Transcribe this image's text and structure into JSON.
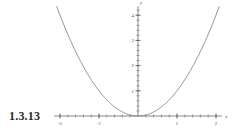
{
  "figure": {
    "exercise_label": "1.3.13",
    "background_color": "#ffffff",
    "curve_color": "#777777",
    "axis_color": "#555555"
  },
  "chart_data": {
    "type": "line",
    "title": "",
    "xlabel": "x",
    "ylabel": "y",
    "function": "y = x^2",
    "xlim": [
      -2.15,
      2.15
    ],
    "ylim": [
      0,
      4.35
    ],
    "grid": false,
    "legend": null,
    "x_ticklabels": [
      "-2",
      "-1",
      "1",
      "2"
    ],
    "x_tickvalues": [
      -2,
      -1,
      1,
      2
    ],
    "y_ticklabels": [
      "1",
      "2",
      "3",
      "4"
    ],
    "y_tickvalues": [
      1,
      2,
      3,
      4
    ],
    "x_minor_step": 0.2,
    "y_minor_step": 0.2,
    "x": [
      -2.1,
      -2.0,
      -1.9,
      -1.8,
      -1.7,
      -1.6,
      -1.5,
      -1.4,
      -1.3,
      -1.2,
      -1.1,
      -1.0,
      -0.9,
      -0.8,
      -0.7,
      -0.6,
      -0.5,
      -0.4,
      -0.3,
      -0.2,
      -0.1,
      0.0,
      0.1,
      0.2,
      0.3,
      0.4,
      0.5,
      0.6,
      0.7,
      0.8,
      0.9,
      1.0,
      1.1,
      1.2,
      1.3,
      1.4,
      1.5,
      1.6,
      1.7,
      1.8,
      1.9,
      2.0,
      2.1
    ],
    "y": [
      4.41,
      4.0,
      3.61,
      3.24,
      2.89,
      2.56,
      2.25,
      1.96,
      1.69,
      1.44,
      1.21,
      1.0,
      0.81,
      0.64,
      0.49,
      0.36,
      0.25,
      0.16,
      0.09,
      0.04,
      0.01,
      0.0,
      0.01,
      0.04,
      0.09,
      0.16,
      0.25,
      0.36,
      0.49,
      0.64,
      0.81,
      1.0,
      1.21,
      1.44,
      1.69,
      1.96,
      2.25,
      2.56,
      2.89,
      3.24,
      3.61,
      4.0,
      4.41
    ]
  }
}
